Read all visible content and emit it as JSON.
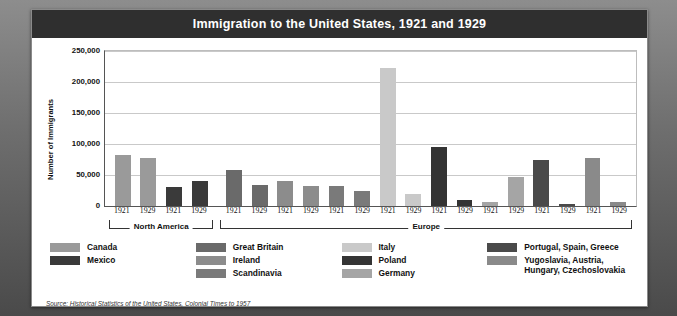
{
  "title": "Immigration to the United States, 1921 and 1929",
  "source": "Source: Historical Statistics of the United States, Colonial Times to 1957",
  "regions": [
    {
      "name": "North America",
      "span": 4
    },
    {
      "name": "Europe",
      "span": 16
    }
  ],
  "legend": [
    {
      "columns": [
        {
          "label": "Canada",
          "color": "#9a9a9a"
        },
        {
          "label": "Mexico",
          "color": "#3a3a3a"
        }
      ]
    },
    {
      "columns": [
        {
          "label": "Great Britain",
          "color": "#6a6a6a"
        },
        {
          "label": "Ireland",
          "color": "#8c8c8c"
        },
        {
          "label": "Scandinavia",
          "color": "#7a7a7a"
        }
      ]
    },
    {
      "columns": [
        {
          "label": "Italy",
          "color": "#c9c9c9"
        },
        {
          "label": "Poland",
          "color": "#343434"
        },
        {
          "label": "Germany",
          "color": "#a5a5a5"
        }
      ]
    },
    {
      "columns": [
        {
          "label": "Portugal, Spain, Greece",
          "color": "#4a4a4a"
        },
        {
          "label": "Yugoslavia, Austria, Hungary, Czechoslovakia",
          "color": "#8a8a8a"
        }
      ]
    }
  ],
  "chart_data": {
    "type": "bar",
    "title": "Immigration to the United States, 1921 and 1929",
    "xlabel": "",
    "ylabel": "Number of Immigrants",
    "ylim": [
      0,
      250000
    ],
    "yticks": [
      "0",
      "50,000",
      "100,000",
      "150,000",
      "200,000",
      "250,000"
    ],
    "ytick_values": [
      0,
      50000,
      100000,
      150000,
      200000,
      250000
    ],
    "grid": true,
    "legend_position": "bottom",
    "categories": [
      "Canada 1921",
      "Canada 1929",
      "Mexico 1921",
      "Mexico 1929",
      "Great Britain 1921",
      "Great Britain 1929",
      "Ireland 1921",
      "Ireland 1929",
      "Scandinavia 1921",
      "Scandinavia 1929",
      "Italy 1921",
      "Italy 1929",
      "Poland 1921",
      "Poland 1929",
      "Germany 1921",
      "Germany 1929",
      "Portugal, Spain, Greece 1921",
      "Portugal, Spain, Greece 1929",
      "Yugoslavia, Austria, Hungary, Czechoslovakia 1921",
      "Yugoslavia, Austria, Hungary, Czechoslovakia 1929"
    ],
    "bars": [
      {
        "group": "Canada",
        "year": "1921",
        "value": 83000,
        "color": "#9a9a9a",
        "region": "North America"
      },
      {
        "group": "Canada",
        "year": "1929",
        "value": 78000,
        "color": "#9a9a9a",
        "region": "North America"
      },
      {
        "group": "Mexico",
        "year": "1921",
        "value": 31000,
        "color": "#3a3a3a",
        "region": "North America"
      },
      {
        "group": "Mexico",
        "year": "1929",
        "value": 40000,
        "color": "#3a3a3a",
        "region": "North America"
      },
      {
        "group": "Great Britain",
        "year": "1921",
        "value": 58000,
        "color": "#6a6a6a",
        "region": "Europe"
      },
      {
        "group": "Great Britain",
        "year": "1929",
        "value": 34000,
        "color": "#6a6a6a",
        "region": "Europe"
      },
      {
        "group": "Ireland",
        "year": "1921",
        "value": 40000,
        "color": "#8c8c8c",
        "region": "Europe"
      },
      {
        "group": "Ireland",
        "year": "1929",
        "value": 32000,
        "color": "#8c8c8c",
        "region": "Europe"
      },
      {
        "group": "Scandinavia",
        "year": "1921",
        "value": 33000,
        "color": "#7a7a7a",
        "region": "Europe"
      },
      {
        "group": "Scandinavia",
        "year": "1929",
        "value": 25000,
        "color": "#7a7a7a",
        "region": "Europe"
      },
      {
        "group": "Italy",
        "year": "1921",
        "value": 222000,
        "color": "#c9c9c9",
        "region": "Europe"
      },
      {
        "group": "Italy",
        "year": "1929",
        "value": 19000,
        "color": "#c9c9c9",
        "region": "Europe"
      },
      {
        "group": "Poland",
        "year": "1921",
        "value": 95000,
        "color": "#343434",
        "region": "Europe"
      },
      {
        "group": "Poland",
        "year": "1929",
        "value": 10000,
        "color": "#343434",
        "region": "Europe"
      },
      {
        "group": "Germany",
        "year": "1921",
        "value": 7000,
        "color": "#a5a5a5",
        "region": "Europe"
      },
      {
        "group": "Germany",
        "year": "1929",
        "value": 47000,
        "color": "#a5a5a5",
        "region": "Europe"
      },
      {
        "group": "Portugal, Spain, Greece",
        "year": "1921",
        "value": 75000,
        "color": "#4a4a4a",
        "region": "Europe"
      },
      {
        "group": "Portugal, Spain, Greece",
        "year": "1929",
        "value": 4000,
        "color": "#4a4a4a",
        "region": "Europe"
      },
      {
        "group": "Yugoslavia, Austria, Hungary, Czechoslovakia",
        "year": "1921",
        "value": 77000,
        "color": "#8a8a8a",
        "region": "Europe"
      },
      {
        "group": "Yugoslavia, Austria, Hungary, Czechoslovakia",
        "year": "1929",
        "value": 6000,
        "color": "#8a8a8a",
        "region": "Europe"
      }
    ]
  }
}
